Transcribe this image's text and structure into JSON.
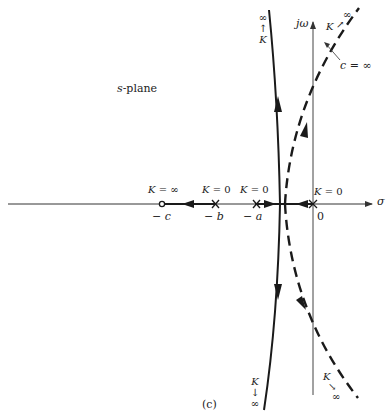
{
  "figure": {
    "caption": "(c)",
    "plane_label": "s-plane",
    "plane_label_var": "s",
    "plane_label_rest": "-plane",
    "axes": {
      "real_label": "σ",
      "imag_label": "jω",
      "origin_label": "0"
    },
    "poles_zeros": [
      {
        "name": "-c",
        "label": "− c",
        "type": "zero",
        "gain_label": "K = ∞"
      },
      {
        "name": "-b",
        "label": "− b",
        "type": "pole",
        "gain_label": "K = 0"
      },
      {
        "name": "-a",
        "label": "− a",
        "type": "pole",
        "gain_label": "K = 0"
      },
      {
        "name": "0",
        "label": "0",
        "type": "pole",
        "gain_label": "K = 0"
      }
    ],
    "asymptote_labels": {
      "solid_top": {
        "inf": "∞",
        "arrow": "↑",
        "k": "K"
      },
      "solid_bottom": {
        "k": "K",
        "arrow": "↓",
        "inf": "∞"
      },
      "dashed_top": {
        "k": "K",
        "arrow": "↗",
        "inf": "∞"
      },
      "dashed_bottom": {
        "k": "K",
        "arrow": "↘",
        "inf": "∞"
      }
    },
    "annotation": {
      "text": "c = ∞",
      "var": "c",
      "rest": " = ∞"
    },
    "colors": {
      "line": "#1a1a1a",
      "axis": "#333333",
      "background": "#ffffff"
    }
  }
}
